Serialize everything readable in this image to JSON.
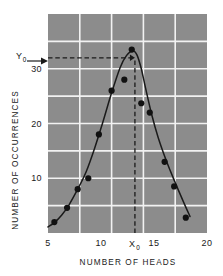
{
  "figure": {
    "background_color": "#ffffff",
    "plot_background_color": "#8c8c8c",
    "grid_color": "#f2f2f2",
    "curve_color": "#1a1a1a",
    "marker_color": "#111111",
    "annotation_color": "#1a1a1a"
  },
  "chart_data": {
    "type": "scatter",
    "title": "",
    "subtitle": "",
    "xlabel": "NUMBER OF HEADS",
    "ylabel": "NUMBER OF OCCURRENCES",
    "xlim": [
      5,
      20
    ],
    "ylim": [
      0,
      40
    ],
    "grid": true,
    "grid_x": [
      5,
      8,
      11,
      14,
      17,
      20
    ],
    "grid_y": [
      0,
      5,
      10,
      15,
      20,
      25,
      30,
      35,
      40
    ],
    "legend": null,
    "legend_position": "none",
    "xticks": [
      5,
      10,
      15,
      20
    ],
    "xtick_labels": [
      "5",
      "10",
      "15",
      "20"
    ],
    "yticks": [
      10,
      20,
      30
    ],
    "ytick_labels": [
      "10",
      "20",
      "30"
    ],
    "series": [
      {
        "name": "observed occurrences",
        "marker": "filled-circle",
        "x": [
          5.6,
          6.8,
          7.8,
          8.8,
          9.8,
          11.0,
          12.2,
          12.9,
          13.8,
          14.6,
          16.0,
          16.9,
          18.0
        ],
        "y": [
          2.0,
          4.6,
          8.0,
          10.0,
          18.0,
          26.0,
          28.0,
          33.5,
          23.7,
          22.0,
          13.0,
          8.5,
          2.8
        ]
      },
      {
        "name": "fitted binomial curve",
        "marker": "none",
        "style": "solid-line",
        "x": [
          5.0,
          5.6,
          6.3,
          7.0,
          7.8,
          8.6,
          9.4,
          10.2,
          11.0,
          11.8,
          12.4,
          13.0,
          13.4,
          13.8,
          14.2,
          14.8,
          15.4,
          16.2,
          17.0,
          17.8,
          18.4
        ],
        "y": [
          1.1,
          1.9,
          3.3,
          5.2,
          8.0,
          11.2,
          15.5,
          20.4,
          25.6,
          30.2,
          32.4,
          33.3,
          32.5,
          30.0,
          26.5,
          21.5,
          17.4,
          13.0,
          9.2,
          5.6,
          3.0
        ]
      }
    ],
    "annotations": [
      {
        "name": "y0-reference",
        "label": "Y",
        "subscript": "0",
        "type": "horizontal-dashed-line-with-arrow",
        "value": 32.0,
        "from_x": 5,
        "to_x": 13.2
      },
      {
        "name": "x0-reference",
        "label": "X",
        "subscript": "0",
        "type": "vertical-dashed-line",
        "value": 13.2,
        "from_y": 0,
        "to_y": 32.0
      }
    ]
  },
  "axis_titles": {
    "x": "NUMBER OF HEADS",
    "y": "NUMBER OF OCCURRENCES"
  }
}
